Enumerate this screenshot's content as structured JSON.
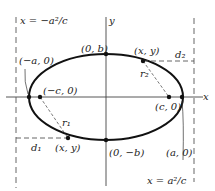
{
  "diagram": {
    "axes": {
      "x_label": "x",
      "y_label": "y"
    },
    "directrices": {
      "left": "x = −a²/c",
      "right": "x = a²/c"
    },
    "points": {
      "top_vertex": "(0, b)",
      "bottom_vertex": "(0, −b)",
      "left_vertex": "(−a, 0)",
      "right_vertex": "(a, 0)",
      "left_focus": "(−c, 0)",
      "right_focus": "(c, 0)",
      "point_upper_right": "(x, y)",
      "point_lower_left": "(x, y)"
    },
    "distances": {
      "r1": "r₁",
      "r2": "r₂",
      "d1": "d₁",
      "d2": "d₂"
    },
    "colors": {
      "ellipse": "#111111",
      "axes": "#333333",
      "dashed": "#444444"
    }
  }
}
